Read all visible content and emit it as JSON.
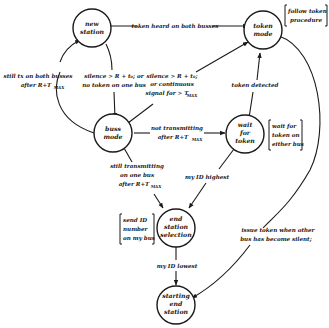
{
  "diagram": {
    "type": "state-transition-diagram",
    "nodes": {
      "new_station": {
        "line1": "new",
        "line2": "station",
        "line3": ""
      },
      "token_mode": {
        "line1": "token",
        "line2": "mode",
        "line3": ""
      },
      "buss_mode": {
        "line1": "buss",
        "line2": "mode",
        "line3": ""
      },
      "wait_for_token": {
        "line1": "wait",
        "line2": "for",
        "line3": "token"
      },
      "end_station_selection": {
        "line1": "end",
        "line2": "station",
        "line3": "selection"
      },
      "starting_end_station": {
        "line1": "starting",
        "line2": "end",
        "line3": "station"
      }
    },
    "edges": {
      "token_heard": {
        "line1": "token heard on both busses"
      },
      "still_tx_both": {
        "line1": "still tx on both busses",
        "line2": "after R+T",
        "sub": "MAX"
      },
      "silence_new_to_buss": {
        "line1": "silence > R + t₀; or",
        "line2": "no token on one bus"
      },
      "silence_buss_to_token": {
        "line1": "silence > R + t₀;",
        "line2": "or continuous",
        "line3": "signal for > T",
        "sub": "MAX"
      },
      "token_detected": {
        "line1": "token detected"
      },
      "not_transmitting": {
        "line1": "not transmitting",
        "line2": "after R+T",
        "sub": "MAX"
      },
      "still_transmitting_one": {
        "line1": "still transmitting",
        "line2": "on one bus",
        "line3": "after R+T",
        "sub": "MAX"
      },
      "my_id_highest": {
        "line1": "my ID highest"
      },
      "my_id_lowest": {
        "line1": "my ID lowest"
      },
      "issue_token": {
        "line1": "issue token when other",
        "line2": "bus has become silent;"
      }
    },
    "notes": {
      "follow_token": {
        "line1": "follow token",
        "line2": "procedure"
      },
      "wait_other_bus": {
        "line1": "wait for",
        "line2": "token on",
        "line3": "either bus"
      },
      "send_id": {
        "line1": "send ID",
        "line2": "number",
        "line3": "on my bus"
      }
    }
  }
}
